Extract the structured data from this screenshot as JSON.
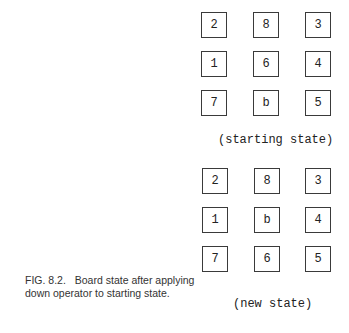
{
  "figure": {
    "number": "FIG. 8.2.",
    "caption": "Board state after applying down operator to starting state."
  },
  "boards": [
    {
      "label": "(starting state)",
      "tiles": [
        "2",
        "8",
        "3",
        "1",
        "6",
        "4",
        "7",
        "b",
        "5"
      ]
    },
    {
      "label": "(new state)",
      "tiles": [
        "2",
        "8",
        "3",
        "1",
        "b",
        "4",
        "7",
        "6",
        "5"
      ]
    }
  ]
}
